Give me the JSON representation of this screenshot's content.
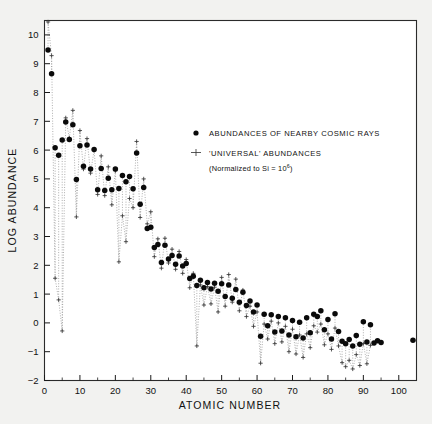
{
  "figure": {
    "background_color": "#f2f2f0",
    "plot_background": "#ffffff"
  },
  "axes": {
    "x_title": "ATOMIC NUMBER",
    "y_title": "LOG ABUNDANCE",
    "x_ticks": [
      0,
      10,
      20,
      30,
      40,
      50,
      60,
      70,
      80,
      90,
      100
    ],
    "y_ticks": [
      -2,
      -1,
      0,
      1,
      2,
      3,
      4,
      5,
      6,
      7,
      8,
      9,
      10
    ]
  },
  "legend": {
    "items": [
      {
        "marker": "filled-circle",
        "label": "ABUNDANCES OF NEARBY COSMIC RAYS"
      },
      {
        "marker": "cross-bar",
        "label": "'UNIVERSAL' ABUNDANCES"
      }
    ],
    "note_prefix": "(Normalized to Si = 10",
    "note_exponent": "6",
    "note_suffix": ")"
  },
  "chart_data": {
    "type": "scatter",
    "title": "",
    "xlabel": "ATOMIC NUMBER",
    "ylabel": "LOG ABUNDANCE",
    "xlim": [
      0,
      105
    ],
    "ylim": [
      -2,
      10.5
    ],
    "grid": false,
    "legend_position": "upper-right-inside",
    "series": [
      {
        "name": "ABUNDANCES OF NEARBY COSMIC RAYS",
        "marker": "filled-circle",
        "color": "#0a0a0a",
        "points": [
          [
            1,
            9.48
          ],
          [
            2,
            8.65
          ],
          [
            3,
            6.08
          ],
          [
            4,
            5.82
          ],
          [
            5,
            6.35
          ],
          [
            6,
            6.98
          ],
          [
            7,
            6.37
          ],
          [
            8,
            6.88
          ],
          [
            9,
            4.98
          ],
          [
            10,
            6.15
          ],
          [
            11,
            5.44
          ],
          [
            12,
            6.18
          ],
          [
            13,
            5.34
          ],
          [
            14,
            6.02
          ],
          [
            15,
            4.62
          ],
          [
            16,
            5.36
          ],
          [
            17,
            4.6
          ],
          [
            18,
            5.02
          ],
          [
            19,
            4.62
          ],
          [
            20,
            5.34
          ],
          [
            21,
            4.67
          ],
          [
            22,
            5.12
          ],
          [
            23,
            4.9
          ],
          [
            24,
            5.08
          ],
          [
            25,
            4.66
          ],
          [
            26,
            5.9
          ],
          [
            27,
            4.12
          ],
          [
            28,
            4.7
          ],
          [
            29,
            3.28
          ],
          [
            30,
            3.32
          ],
          [
            31,
            2.62
          ],
          [
            32,
            2.72
          ],
          [
            33,
            2.1
          ],
          [
            34,
            2.7
          ],
          [
            35,
            2.22
          ],
          [
            36,
            2.34
          ],
          [
            37,
            2.04
          ],
          [
            38,
            2.32
          ],
          [
            39,
            1.98
          ],
          [
            40,
            2.06
          ],
          [
            41,
            1.54
          ],
          [
            42,
            1.62
          ],
          [
            43,
            1.3
          ],
          [
            44,
            1.48
          ],
          [
            45,
            1.22
          ],
          [
            46,
            1.4
          ],
          [
            47,
            1.18
          ],
          [
            48,
            1.38
          ],
          [
            49,
            1.1
          ],
          [
            50,
            1.36
          ],
          [
            51,
            0.92
          ],
          [
            52,
            1.32
          ],
          [
            53,
            0.86
          ],
          [
            54,
            1.16
          ],
          [
            55,
            0.72
          ],
          [
            56,
            1.06
          ],
          [
            57,
            0.6
          ],
          [
            58,
            0.76
          ],
          [
            59,
            0.38
          ],
          [
            60,
            0.62
          ],
          [
            61,
            -0.46
          ],
          [
            62,
            0.3
          ],
          [
            63,
            -0.1
          ],
          [
            64,
            0.28
          ],
          [
            65,
            -0.32
          ],
          [
            66,
            0.22
          ],
          [
            67,
            -0.28
          ],
          [
            68,
            0.18
          ],
          [
            69,
            -0.42
          ],
          [
            70,
            0.08
          ],
          [
            71,
            -0.48
          ],
          [
            72,
            0.02
          ],
          [
            73,
            -0.52
          ],
          [
            74,
            0.18
          ],
          [
            75,
            -0.34
          ],
          [
            76,
            0.3
          ],
          [
            77,
            0.22
          ],
          [
            78,
            0.42
          ],
          [
            79,
            -0.24
          ],
          [
            80,
            0.12
          ],
          [
            81,
            -0.56
          ],
          [
            82,
            0.32
          ],
          [
            83,
            -0.3
          ],
          [
            84,
            -0.64
          ],
          [
            85,
            -0.72
          ],
          [
            86,
            -0.58
          ],
          [
            87,
            -0.8
          ],
          [
            88,
            -0.44
          ],
          [
            89,
            -0.74
          ],
          [
            90,
            0.04
          ],
          [
            91,
            -0.66
          ],
          [
            92,
            -0.06
          ],
          [
            93,
            -0.7
          ],
          [
            94,
            -0.62
          ],
          [
            95,
            -0.68
          ],
          [
            104,
            -0.6
          ]
        ]
      },
      {
        "name": "'UNIVERSAL' ABUNDANCES",
        "marker": "cross-bar",
        "color": "#3a3a3a",
        "points": [
          [
            1,
            10.45
          ],
          [
            2,
            9.28
          ],
          [
            3,
            1.55
          ],
          [
            4,
            0.8
          ],
          [
            5,
            -0.28
          ],
          [
            6,
            7.12
          ],
          [
            7,
            6.42
          ],
          [
            8,
            7.38
          ],
          [
            9,
            3.68
          ],
          [
            10,
            6.68
          ],
          [
            11,
            5.34
          ],
          [
            12,
            6.4
          ],
          [
            13,
            5.2
          ],
          [
            14,
            6.0
          ],
          [
            15,
            4.46
          ],
          [
            16,
            5.8
          ],
          [
            17,
            4.42
          ],
          [
            18,
            5.42
          ],
          [
            19,
            4.1
          ],
          [
            20,
            5.28
          ],
          [
            21,
            2.12
          ],
          [
            22,
            3.72
          ],
          [
            23,
            2.82
          ],
          [
            24,
            4.32
          ],
          [
            25,
            4.0
          ],
          [
            26,
            6.3
          ],
          [
            27,
            3.66
          ],
          [
            28,
            5.0
          ],
          [
            29,
            3.44
          ],
          [
            30,
            3.86
          ],
          [
            31,
            2.3
          ],
          [
            32,
            2.92
          ],
          [
            33,
            1.9
          ],
          [
            34,
            2.94
          ],
          [
            35,
            2.08
          ],
          [
            36,
            2.56
          ],
          [
            37,
            1.86
          ],
          [
            38,
            2.48
          ],
          [
            39,
            1.72
          ],
          [
            40,
            2.2
          ],
          [
            41,
            1.22
          ],
          [
            42,
            1.72
          ],
          [
            43,
            -0.8
          ],
          [
            44,
            1.32
          ],
          [
            45,
            0.62
          ],
          [
            46,
            1.26
          ],
          [
            47,
            0.66
          ],
          [
            48,
            1.24
          ],
          [
            49,
            0.38
          ],
          [
            50,
            1.58
          ],
          [
            51,
            0.58
          ],
          [
            52,
            1.68
          ],
          [
            53,
            0.72
          ],
          [
            54,
            1.52
          ],
          [
            55,
            0.42
          ],
          [
            56,
            1.14
          ],
          [
            57,
            0.22
          ],
          [
            58,
            0.58
          ],
          [
            59,
            -0.12
          ],
          [
            60,
            0.38
          ],
          [
            61,
            -1.4
          ],
          [
            62,
            -0.04
          ],
          [
            63,
            -0.56
          ],
          [
            64,
            0.06
          ],
          [
            65,
            -0.72
          ],
          [
            66,
            0.0
          ],
          [
            67,
            -0.66
          ],
          [
            68,
            -0.12
          ],
          [
            69,
            -1.0
          ],
          [
            70,
            -0.22
          ],
          [
            71,
            -1.08
          ],
          [
            72,
            -0.42
          ],
          [
            73,
            -1.2
          ],
          [
            74,
            -0.38
          ],
          [
            75,
            -0.86
          ],
          [
            76,
            -0.1
          ],
          [
            77,
            -0.32
          ],
          [
            78,
            -0.04
          ],
          [
            79,
            -0.76
          ],
          [
            80,
            -0.38
          ],
          [
            81,
            -0.92
          ],
          [
            82,
            -0.18
          ],
          [
            83,
            -0.8
          ],
          [
            84,
            -1.38
          ],
          [
            85,
            -1.52
          ],
          [
            86,
            -1.3
          ],
          [
            87,
            -1.6
          ],
          [
            88,
            -1.1
          ],
          [
            89,
            -1.48
          ],
          [
            90,
            -0.72
          ],
          [
            91,
            -1.42
          ],
          [
            92,
            -0.78
          ]
        ]
      }
    ]
  }
}
